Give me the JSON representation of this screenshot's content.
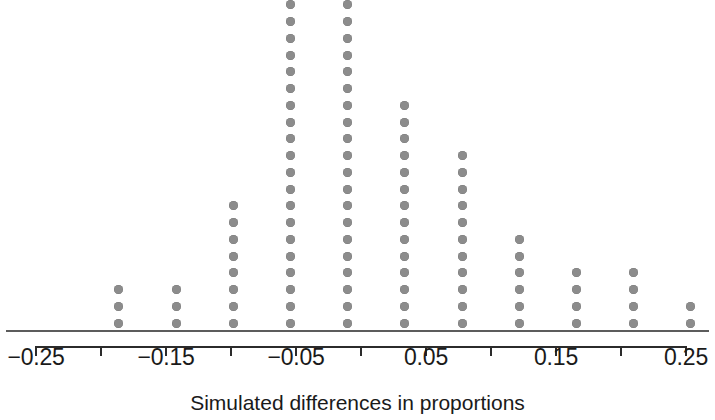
{
  "chart_data": {
    "type": "scatter",
    "plot_style": "stacked-dotplot",
    "title": "",
    "subtitle": "",
    "xlabel": "Simulated differences in proportions",
    "ylabel": "",
    "xlim": [
      -0.275,
      0.275
    ],
    "ylim": [
      0,
      21
    ],
    "grid": false,
    "legend": null,
    "tick_labels": [
      "−0.25",
      "−0.15",
      "−0.05",
      "0.05",
      "0.15",
      "0.25"
    ],
    "tick_values": [
      -0.25,
      -0.15,
      -0.05,
      0.05,
      0.15,
      0.25
    ],
    "minor_tick_values": [
      -0.2,
      -0.1,
      0.0,
      0.1,
      0.2
    ],
    "all_tick_values": [
      -0.25,
      -0.2,
      -0.15,
      -0.1,
      -0.05,
      0.0,
      0.05,
      0.1,
      0.15,
      0.2,
      0.25
    ],
    "dot_color": "#8c8c8c",
    "axis_color": "#2b2b2b",
    "baseline_color": "#5c5c5c",
    "categories": [
      -0.19,
      -0.15,
      -0.105,
      -0.055,
      -0.015,
      0.03,
      0.075,
      0.12,
      0.165,
      0.21,
      0.25
    ],
    "values": [
      3,
      3,
      8,
      23,
      25,
      14,
      11,
      6,
      4,
      4,
      2
    ],
    "total_dots": 103,
    "columns": [
      {
        "x": -0.19,
        "count": 3,
        "px": 118
      },
      {
        "x": -0.15,
        "count": 3,
        "px": 176
      },
      {
        "x": -0.105,
        "count": 8,
        "px": 233
      },
      {
        "x": -0.055,
        "count": 23,
        "px": 290
      },
      {
        "x": -0.015,
        "count": 25,
        "px": 347
      },
      {
        "x": 0.03,
        "count": 14,
        "px": 404
      },
      {
        "x": 0.075,
        "count": 11,
        "px": 462
      },
      {
        "x": 0.12,
        "count": 6,
        "px": 519
      },
      {
        "x": 0.165,
        "count": 4,
        "px": 576
      },
      {
        "x": 0.21,
        "count": 4,
        "px": 633
      },
      {
        "x": 0.25,
        "count": 2,
        "px": 690
      }
    ]
  },
  "axis": {
    "title": "Simulated differences in proportions",
    "labels": [
      {
        "text": "−0.25",
        "px": 36
      },
      {
        "text": "−0.15",
        "px": 166
      },
      {
        "text": "−0.05",
        "px": 296
      },
      {
        "text": "0.05",
        "px": 426
      },
      {
        "text": "0.15",
        "px": 556
      },
      {
        "text": "0.25",
        "px": 686
      }
    ]
  }
}
